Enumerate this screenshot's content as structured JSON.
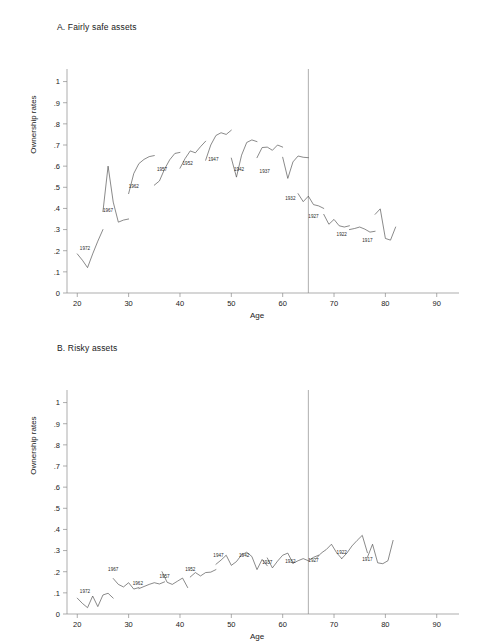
{
  "figure": {
    "background": "#ffffff",
    "line_color": "#4a4a4a",
    "axis_color": "#8a8a8a"
  },
  "panels": [
    {
      "id": "panel-a",
      "title": "A. Fairly safe assets",
      "xlabel": "Age",
      "ylabel": "Ownership rates"
    },
    {
      "id": "panel-b",
      "title": "B. Risky assets",
      "xlabel": "Age",
      "ylabel": "Ownership rates"
    }
  ],
  "chart_data": [
    {
      "type": "line",
      "title": "A. Fairly safe assets",
      "xlabel": "Age",
      "ylabel": "Ownership rates",
      "xlim": [
        18,
        92
      ],
      "ylim": [
        0,
        1.05
      ],
      "xticks": [
        20,
        30,
        40,
        50,
        60,
        70,
        80,
        90
      ],
      "xticklabels": [
        "20",
        "30",
        "40",
        "50",
        "60",
        "70",
        "80",
        "90"
      ],
      "yticks": [
        0,
        0.1,
        0.2,
        0.3,
        0.4,
        0.5,
        0.6,
        0.7,
        0.8,
        0.9,
        1
      ],
      "yticklabels": [
        "0",
        ".1",
        ".2",
        ".3",
        ".4",
        ".5",
        ".6",
        ".7",
        ".8",
        ".9",
        "1"
      ],
      "grid": false,
      "legend": "none",
      "annotations": [
        {
          "text": "1972",
          "x": 21.5,
          "y": 0.205
        },
        {
          "text": "1967",
          "x": 26.0,
          "y": 0.385
        },
        {
          "text": "1962",
          "x": 31.0,
          "y": 0.495
        },
        {
          "text": "1957",
          "x": 36.5,
          "y": 0.575
        },
        {
          "text": "1952",
          "x": 41.5,
          "y": 0.605
        },
        {
          "text": "1947",
          "x": 46.5,
          "y": 0.625
        },
        {
          "text": "1942",
          "x": 51.5,
          "y": 0.578
        },
        {
          "text": "1937",
          "x": 56.5,
          "y": 0.568
        },
        {
          "text": "1932",
          "x": 61.5,
          "y": 0.438
        },
        {
          "text": "1927",
          "x": 66.0,
          "y": 0.355
        },
        {
          "text": "1922",
          "x": 71.5,
          "y": 0.268
        },
        {
          "text": "1917",
          "x": 76.5,
          "y": 0.243
        }
      ],
      "reference_lines": [
        {
          "axis": "x",
          "value": 65,
          "label": "age 65"
        }
      ],
      "series": [
        {
          "name": "cohort-1972",
          "x": [
            20.0,
            21.0,
            22.0,
            23.0,
            24.0,
            25.0
          ],
          "y": [
            0.185,
            0.155,
            0.12,
            0.185,
            0.245,
            0.3
          ]
        },
        {
          "name": "cohort-1967",
          "x": [
            25.0,
            26.0,
            27.0,
            28.0,
            29.0,
            30.0
          ],
          "y": [
            0.385,
            0.6,
            0.43,
            0.335,
            0.345,
            0.35
          ]
        },
        {
          "name": "cohort-1962",
          "x": [
            30.0,
            31.0,
            32.0,
            33.0,
            34.0,
            35.0
          ],
          "y": [
            0.47,
            0.565,
            0.612,
            0.632,
            0.645,
            0.65
          ]
        },
        {
          "name": "cohort-1957",
          "x": [
            35.0,
            36.0,
            37.0,
            38.0,
            39.0,
            40.0
          ],
          "y": [
            0.51,
            0.53,
            0.586,
            0.63,
            0.66,
            0.665
          ]
        },
        {
          "name": "cohort-1952",
          "x": [
            40.0,
            41.0,
            42.0,
            43.0,
            44.0,
            45.0
          ],
          "y": [
            0.59,
            0.636,
            0.672,
            0.663,
            0.692,
            0.718
          ]
        },
        {
          "name": "cohort-1947",
          "x": [
            45.0,
            46.0,
            47.0,
            48.0,
            49.0,
            50.0
          ],
          "y": [
            0.628,
            0.7,
            0.745,
            0.758,
            0.75,
            0.77
          ]
        },
        {
          "name": "cohort-1942",
          "x": [
            50.0,
            51.0,
            52.0,
            53.0,
            54.0,
            55.0
          ],
          "y": [
            0.638,
            0.548,
            0.652,
            0.712,
            0.724,
            0.716
          ]
        },
        {
          "name": "cohort-1937",
          "x": [
            55.0,
            56.0,
            57.0,
            58.0,
            59.0,
            60.0
          ],
          "y": [
            0.64,
            0.688,
            0.69,
            0.675,
            0.7,
            0.69
          ]
        },
        {
          "name": "cohort-1932",
          "x": [
            60.0,
            61.0,
            62.0,
            63.0,
            64.0,
            65.0
          ],
          "y": [
            0.642,
            0.542,
            0.62,
            0.648,
            0.642,
            0.64
          ]
        },
        {
          "name": "cohort-1927",
          "x": [
            63.0,
            64.0,
            65.0,
            66.0,
            67.0,
            68.0
          ],
          "y": [
            0.47,
            0.432,
            0.458,
            0.418,
            0.412,
            0.4
          ]
        },
        {
          "name": "cohort-1922",
          "x": [
            68.0,
            69.0,
            70.0,
            71.0,
            72.0,
            73.0
          ],
          "y": [
            0.372,
            0.325,
            0.348,
            0.318,
            0.312,
            0.318
          ]
        },
        {
          "name": "cohort-1917",
          "x": [
            73.0,
            74.0,
            75.0,
            76.0,
            77.0,
            78.0
          ],
          "y": [
            0.3,
            0.305,
            0.312,
            0.302,
            0.288,
            0.292
          ]
        },
        {
          "name": "cohort-tail",
          "x": [
            78.0,
            79.0,
            80.0,
            81.0,
            82.0
          ],
          "y": [
            0.372,
            0.398,
            0.258,
            0.25,
            0.312
          ]
        }
      ]
    },
    {
      "type": "line",
      "title": "B. Risky assets",
      "xlabel": "Age",
      "ylabel": "Ownership rates",
      "xlim": [
        18,
        92
      ],
      "ylim": [
        0,
        1.05
      ],
      "xticks": [
        20,
        30,
        40,
        50,
        60,
        70,
        80,
        90
      ],
      "xticklabels": [
        "20",
        "30",
        "40",
        "50",
        "60",
        "70",
        "80",
        "90"
      ],
      "yticks": [
        0,
        0.1,
        0.2,
        0.3,
        0.4,
        0.5,
        0.6,
        0.7,
        0.8,
        0.9,
        1
      ],
      "yticklabels": [
        "0",
        ".1",
        ".2",
        ".3",
        ".4",
        ".5",
        ".6",
        ".7",
        ".8",
        ".9",
        "1"
      ],
      "grid": false,
      "legend": "none",
      "annotations": [
        {
          "text": "1972",
          "x": 21.5,
          "y": 0.098
        },
        {
          "text": "1967",
          "x": 27.0,
          "y": 0.205
        },
        {
          "text": "1962",
          "x": 31.8,
          "y": 0.135
        },
        {
          "text": "1957",
          "x": 37.0,
          "y": 0.168
        },
        {
          "text": "1952",
          "x": 42.0,
          "y": 0.203
        },
        {
          "text": "1947",
          "x": 47.5,
          "y": 0.268
        },
        {
          "text": "1942",
          "x": 52.5,
          "y": 0.268
        },
        {
          "text": "1937",
          "x": 57.0,
          "y": 0.238
        },
        {
          "text": "1932",
          "x": 61.5,
          "y": 0.243
        },
        {
          "text": "1927",
          "x": 66.0,
          "y": 0.248
        },
        {
          "text": "1922",
          "x": 71.5,
          "y": 0.282
        },
        {
          "text": "1917",
          "x": 76.5,
          "y": 0.252
        }
      ],
      "reference_lines": [
        {
          "axis": "x",
          "value": 65,
          "label": "age 65"
        }
      ],
      "series": [
        {
          "name": "cohort-1972",
          "x": [
            20.0,
            21.0,
            22.0,
            23.0,
            24.0,
            25.0,
            26.0,
            27.0
          ],
          "y": [
            0.075,
            0.05,
            0.03,
            0.085,
            0.035,
            0.09,
            0.098,
            0.075
          ]
        },
        {
          "name": "cohort-1967",
          "x": [
            27.0,
            28.0,
            29.0,
            30.0,
            31.0,
            32.0
          ],
          "y": [
            0.168,
            0.14,
            0.128,
            0.148,
            0.118,
            0.125
          ]
        },
        {
          "name": "cohort-1962",
          "x": [
            32.0,
            33.0,
            34.0,
            35.0,
            36.0,
            37.0
          ],
          "y": [
            0.12,
            0.13,
            0.14,
            0.148,
            0.142,
            0.152
          ]
        },
        {
          "name": "cohort-1957",
          "x": [
            36.5,
            37.5,
            38.5,
            39.5,
            40.5,
            41.5
          ],
          "y": [
            0.2,
            0.15,
            0.14,
            0.155,
            0.17,
            0.125
          ]
        },
        {
          "name": "cohort-1952",
          "x": [
            42.0,
            43.0,
            44.0,
            45.0,
            46.0,
            47.0
          ],
          "y": [
            0.175,
            0.196,
            0.18,
            0.196,
            0.198,
            0.21
          ]
        },
        {
          "name": "cohort-1947",
          "x": [
            47.0,
            48.0,
            49.0,
            50.0,
            51.0,
            52.0
          ],
          "y": [
            0.235,
            0.255,
            0.278,
            0.23,
            0.248,
            0.28
          ]
        },
        {
          "name": "cohort-1942",
          "x": [
            52.0,
            53.0,
            54.0,
            55.0,
            56.0,
            57.0
          ],
          "y": [
            0.28,
            0.292,
            0.272,
            0.21,
            0.258,
            0.228
          ]
        },
        {
          "name": "cohort-1937",
          "x": [
            57.0,
            58.0,
            59.0,
            60.0,
            61.0,
            62.0
          ],
          "y": [
            0.265,
            0.218,
            0.25,
            0.278,
            0.288,
            0.24
          ]
        },
        {
          "name": "cohort-1932",
          "x": [
            62.0,
            63.0,
            64.0,
            65.0,
            66.0,
            67.0
          ],
          "y": [
            0.24,
            0.252,
            0.262,
            0.252,
            0.268,
            0.278
          ]
        },
        {
          "name": "cohort-1927",
          "x": [
            66.5,
            67.5,
            68.5,
            69.5,
            70.5,
            71.5
          ],
          "y": [
            0.262,
            0.288,
            0.305,
            0.33,
            0.29,
            0.262
          ]
        },
        {
          "name": "cohort-1922",
          "x": [
            71.5,
            72.5,
            73.5,
            74.5,
            75.5,
            76.5
          ],
          "y": [
            0.262,
            0.288,
            0.322,
            0.348,
            0.372,
            0.29
          ]
        },
        {
          "name": "cohort-1917",
          "x": [
            76.5,
            77.5,
            78.5,
            79.5,
            80.5,
            81.5
          ],
          "y": [
            0.268,
            0.33,
            0.242,
            0.238,
            0.252,
            0.348
          ]
        }
      ]
    }
  ]
}
